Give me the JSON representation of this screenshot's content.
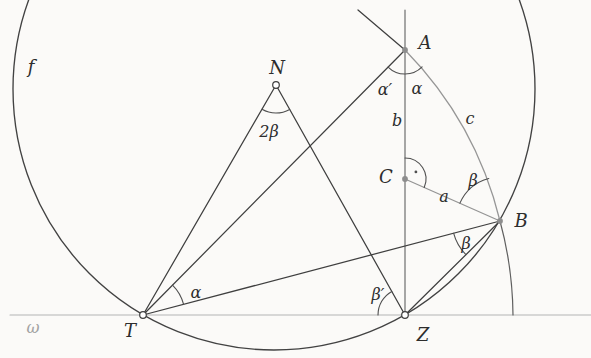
{
  "figure": {
    "width": 591,
    "height": 358,
    "background": "#fbfaf8",
    "colors": {
      "dark_line": "#3f3f3f",
      "medium_line": "#6e6e6e",
      "light_line": "#969696",
      "arc_line": "#4f4f4f",
      "baseline": "#b4b4b4",
      "label": "#2d2d2d",
      "gray_label": "#a2a2a2",
      "point_fill": "#8d8d8d",
      "circle_f": "#424242"
    },
    "circles": [
      {
        "name": "circle-f",
        "cx": 274,
        "cy": 89,
        "r": 261,
        "color": "#424242",
        "w": 1.35
      }
    ],
    "segments": [
      {
        "name": "line-omega-baseline",
        "x1": 10,
        "y1": 315,
        "x2": 591,
        "y2": 315,
        "color": "#b4b4b4",
        "w": 1.1
      },
      {
        "name": "line-b-vertical-A-Z",
        "x1": 405,
        "y1": 10,
        "x2": 405,
        "y2": 315,
        "color": "#6e6e6e",
        "w": 1.2
      },
      {
        "name": "line-N-T",
        "x1": 276,
        "y1": 85,
        "x2": 143,
        "y2": 315,
        "color": "#3f3f3f",
        "w": 1.25
      },
      {
        "name": "line-N-Z",
        "x1": 276,
        "y1": 85,
        "x2": 405,
        "y2": 315,
        "color": "#3f3f3f",
        "w": 1.25
      },
      {
        "name": "line-T-A",
        "x1": 143,
        "y1": 315,
        "x2": 405,
        "y2": 50,
        "color": "#3f3f3f",
        "w": 1.25
      },
      {
        "name": "line-T-B",
        "x1": 143,
        "y1": 315,
        "x2": 500,
        "y2": 221,
        "color": "#3f3f3f",
        "w": 1.25
      },
      {
        "name": "line-Z-B-chord",
        "x1": 405,
        "y1": 315,
        "x2": 500,
        "y2": 221,
        "color": "#3f3f3f",
        "w": 1.25
      },
      {
        "name": "line-tangent-ray-at-A",
        "x1": 358,
        "y1": 10,
        "x2": 405,
        "y2": 50,
        "color": "#3f3f3f",
        "w": 1.25
      },
      {
        "name": "line-a-C-B",
        "x1": 405,
        "y1": 179,
        "x2": 500,
        "y2": 221,
        "color": "#949494",
        "w": 1.2
      }
    ],
    "paths": [
      {
        "name": "arc-c-A-to-B",
        "d": "M 405 50 A 370 370 0 0 1 500 221",
        "color": "#969696",
        "w": 1.25
      },
      {
        "name": "arc-B-to-omega",
        "d": "M 500 221 A 370 370 0 0 1 513 315",
        "color": "#5f5f5f",
        "w": 1.2
      },
      {
        "name": "angle-arc-2beta-at-N",
        "d": "M 289.7 109.4 A 28 28 0 0 1 262 109.3",
        "color": "#4f4f4f",
        "w": 1.1
      },
      {
        "name": "angle-arc-alpha-at-A",
        "d": "M 422.1 66.9 A 24 24 0 0 1 388.1 67.1",
        "color": "#4f4f4f",
        "w": 1.1
      },
      {
        "name": "angle-arc-alpha-at-T",
        "d": "M 172.5 285.1 A 42 42 0 0 1 183.6 304.3",
        "color": "#4f4f4f",
        "w": 1.1
      },
      {
        "name": "angle-arc-beta-prime-at-Z",
        "d": "M 378 315 A 27 27 0 0 1 391.8 291.4",
        "color": "#4f4f4f",
        "w": 1.1
      },
      {
        "name": "angle-arc-beta-lower-at-B",
        "d": "M 465.9 254.7 A 48 48 0 0 1 453.6 233.2",
        "color": "#4f4f4f",
        "w": 1.1
      },
      {
        "name": "angle-arc-beta-upper-at-B",
        "d": "M 459.9 203.1 A 44 44 0 0 1 488.8 178.5",
        "color": "#4f4f4f",
        "w": 1.1
      },
      {
        "name": "right-angle-arc-at-C",
        "d": "M 405 158 A 21 21 0 0 1 424.2 187.5",
        "color": "#4f4f4f",
        "w": 1.1
      }
    ],
    "dots": [
      {
        "name": "right-angle-dot-at-C",
        "x": 415.9,
        "y": 171.9,
        "r": 1.4,
        "color": "#4f4f4f"
      }
    ],
    "points": [
      {
        "name": "point-N",
        "x": 276,
        "y": 85,
        "style": "open"
      },
      {
        "name": "point-T",
        "x": 143,
        "y": 315,
        "style": "open"
      },
      {
        "name": "point-Z",
        "x": 405,
        "y": 315,
        "style": "open"
      },
      {
        "name": "point-A",
        "x": 405,
        "y": 50,
        "style": "filled"
      },
      {
        "name": "point-B",
        "x": 500,
        "y": 221,
        "style": "filled"
      },
      {
        "name": "point-C",
        "x": 405,
        "y": 179,
        "style": "filled"
      }
    ],
    "labels": [
      {
        "name": "label-f",
        "text": "f",
        "x": 31,
        "y": 66,
        "size": 18,
        "color": "#2d2d2d"
      },
      {
        "name": "label-N",
        "text": "N",
        "x": 277,
        "y": 67,
        "size": 18,
        "color": "#2d2d2d"
      },
      {
        "name": "label-2beta",
        "text": "2β",
        "x": 269,
        "y": 131,
        "size": 16,
        "color": "#2d2d2d"
      },
      {
        "name": "label-A",
        "text": "A",
        "x": 425,
        "y": 42,
        "size": 18,
        "color": "#2d2d2d"
      },
      {
        "name": "label-alpha-prime",
        "text": "α′",
        "x": 385,
        "y": 89,
        "size": 16,
        "color": "#2d2d2d"
      },
      {
        "name": "label-alpha-at-A",
        "text": "α",
        "x": 417,
        "y": 88,
        "size": 16,
        "color": "#2d2d2d"
      },
      {
        "name": "label-b",
        "text": "b",
        "x": 397,
        "y": 120,
        "size": 16,
        "color": "#2d2d2d"
      },
      {
        "name": "label-c",
        "text": "c",
        "x": 470,
        "y": 118,
        "size": 16,
        "color": "#2d2d2d"
      },
      {
        "name": "label-C",
        "text": "C",
        "x": 386,
        "y": 176,
        "size": 18,
        "color": "#2d2d2d"
      },
      {
        "name": "label-a",
        "text": "a",
        "x": 444,
        "y": 196,
        "size": 16,
        "color": "#2d2d2d"
      },
      {
        "name": "label-beta-upper",
        "text": "β",
        "x": 473,
        "y": 180,
        "size": 16,
        "color": "#2d2d2d"
      },
      {
        "name": "label-B",
        "text": "B",
        "x": 521,
        "y": 220,
        "size": 18,
        "color": "#2d2d2d"
      },
      {
        "name": "label-beta-lower",
        "text": "β",
        "x": 466,
        "y": 243,
        "size": 16,
        "color": "#2d2d2d"
      },
      {
        "name": "label-alpha-at-T",
        "text": "α",
        "x": 196,
        "y": 292,
        "size": 16,
        "color": "#2d2d2d"
      },
      {
        "name": "label-beta-prime",
        "text": "β′",
        "x": 378,
        "y": 294,
        "size": 16,
        "color": "#2d2d2d"
      },
      {
        "name": "label-omega",
        "text": "ω",
        "x": 33,
        "y": 327,
        "size": 16,
        "color": "#a2a2a2"
      },
      {
        "name": "label-T",
        "text": "T",
        "x": 130,
        "y": 330,
        "size": 18,
        "color": "#2d2d2d"
      },
      {
        "name": "label-Z",
        "text": "Z",
        "x": 423,
        "y": 334,
        "size": 18,
        "color": "#2d2d2d"
      }
    ]
  }
}
